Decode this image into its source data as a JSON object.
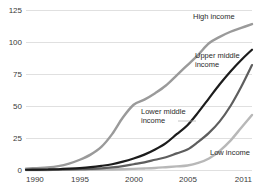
{
  "chart_data": {
    "type": "line",
    "title": "",
    "subtitle": "",
    "xlabel": "",
    "ylabel": "",
    "xlim": [
      1990,
      2011
    ],
    "ylim": [
      0,
      125
    ],
    "grid": true,
    "legend_position": "inline-labels",
    "x_ticks": [
      "1990",
      "1995",
      "2000",
      "2005",
      "2011"
    ],
    "x_tick_values": [
      1990,
      1995,
      2000,
      2005,
      2011
    ],
    "y_ticks": [
      "0",
      "25",
      "50",
      "75",
      "100",
      "125"
    ],
    "y_tick_values": [
      0,
      25,
      50,
      75,
      100,
      125
    ],
    "x": [
      1990,
      1991,
      1992,
      1993,
      1994,
      1995,
      1996,
      1997,
      1998,
      1999,
      2000,
      2001,
      2002,
      2003,
      2004,
      2005,
      2006,
      2007,
      2008,
      2009,
      2010,
      2011
    ],
    "series": [
      {
        "name": "High income",
        "label": "High income",
        "color": "#9a9a9a",
        "stroke_width": 2.4,
        "values": [
          1,
          1.5,
          2,
          3,
          5,
          8,
          12,
          18,
          28,
          41,
          51,
          55,
          60,
          66,
          74,
          82,
          90,
          99,
          104,
          108,
          111,
          114
        ]
      },
      {
        "name": "Upper middle income",
        "label": "Upper middle income",
        "color": "#1c1c1c",
        "stroke_width": 2.2,
        "values": [
          0.2,
          0.3,
          0.4,
          0.6,
          1,
          1.5,
          2.2,
          3.2,
          4.5,
          6.5,
          9,
          12,
          16,
          21,
          28,
          35,
          45,
          56,
          67,
          77,
          86,
          94
        ]
      },
      {
        "name": "Lower middle income",
        "label": "Lower middle income",
        "color": "#5e5e5e",
        "stroke_width": 2.2,
        "values": [
          0.1,
          0.1,
          0.2,
          0.3,
          0.4,
          0.6,
          0.9,
          1.3,
          2,
          3,
          4.5,
          6,
          8,
          10,
          13,
          16,
          22,
          29,
          38,
          50,
          65,
          82
        ]
      },
      {
        "name": "Low income",
        "label": "Low income",
        "color": "#b8b8b8",
        "stroke_width": 2.4,
        "values": [
          0.05,
          0.05,
          0.05,
          0.1,
          0.1,
          0.2,
          0.2,
          0.3,
          0.4,
          0.6,
          0.9,
          1.2,
          1.6,
          2.2,
          2.8,
          3.5,
          5.5,
          9,
          15,
          23,
          33,
          43
        ]
      }
    ],
    "annotations": [
      {
        "text": "High income",
        "x": 193,
        "y": 19
      },
      {
        "text": "Upper middle",
        "x": 195,
        "y": 58
      },
      {
        "text": "income",
        "x": 195,
        "y": 67
      },
      {
        "text": "Lower middle",
        "x": 141,
        "y": 114
      },
      {
        "text": "income",
        "x": 141,
        "y": 123
      },
      {
        "text": "Low income",
        "x": 210,
        "y": 155
      }
    ]
  }
}
